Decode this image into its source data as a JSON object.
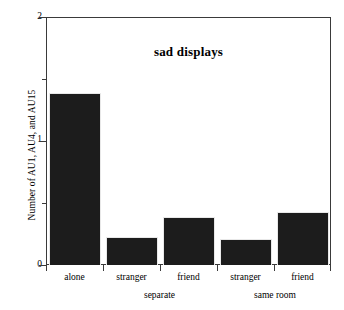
{
  "chart_data": {
    "type": "bar",
    "title": "sad displays",
    "xlabel": "",
    "ylabel": "Number of AU1, AU4, and AU15",
    "categories": [
      "alone",
      "stranger",
      "friend",
      "stranger",
      "friend"
    ],
    "values": [
      1.39,
      0.23,
      0.39,
      0.21,
      0.43
    ],
    "ylim": [
      0,
      2
    ],
    "y_ticks": [
      0,
      1,
      2
    ],
    "y_tick_labels": [
      "0",
      "1",
      "2"
    ],
    "y_minor_ticks": [
      0.5,
      1.5
    ],
    "grid": false,
    "legend": null,
    "bar_color": "#1c1c1c",
    "groups": [
      {
        "label": "separate",
        "categories": [
          "stranger",
          "friend"
        ]
      },
      {
        "label": "same room",
        "categories": [
          "stranger",
          "friend"
        ]
      }
    ],
    "group_labels": [
      "separate",
      "same room"
    ]
  },
  "axis": {
    "y_title": "Number of AU1, AU4, and AU15",
    "tick0": "0",
    "tick1": "1",
    "tick2": "2"
  },
  "title": {
    "text": "sad displays"
  },
  "xlabels": {
    "b0": "alone",
    "b1": "stranger",
    "b2": "friend",
    "b3": "stranger",
    "b4": "friend"
  },
  "groups": {
    "g0": "separate",
    "g1": "same room"
  }
}
